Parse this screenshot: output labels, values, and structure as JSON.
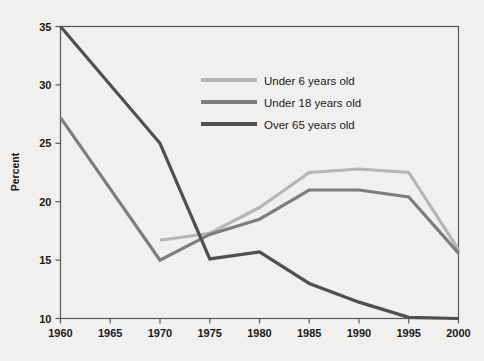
{
  "chart_data": {
    "type": "line",
    "title": "",
    "subtitle": "",
    "xlabel": "",
    "ylabel": "Percent",
    "x": [
      1960,
      1965,
      1970,
      1975,
      1980,
      1985,
      1990,
      1995,
      2000
    ],
    "xtick_labels": [
      "1960",
      "1965",
      "1970",
      "1975",
      "1980",
      "1985",
      "1990",
      "1995",
      "2000"
    ],
    "ytick_labels": [
      "10",
      "15",
      "20",
      "25",
      "30",
      "35"
    ],
    "ytick_values": [
      10,
      15,
      20,
      25,
      30,
      35
    ],
    "xlim": [
      1960,
      2000
    ],
    "ylim": [
      10,
      35
    ],
    "grid": false,
    "legend_position": "top-center",
    "series": [
      {
        "name": "Under 6 years old",
        "color": "#b5b5b5",
        "x": [
          1970,
          1975,
          1980,
          1985,
          1990,
          1995,
          2000
        ],
        "values": [
          16.7,
          17.3,
          19.5,
          22.5,
          22.8,
          22.5,
          15.9
        ]
      },
      {
        "name": "Under 18 years old",
        "color": "#7d7d7d",
        "x": [
          1960,
          1970,
          1975,
          1980,
          1985,
          1990,
          1995,
          2000
        ],
        "values": [
          27.2,
          15.0,
          17.2,
          18.5,
          21.0,
          21.0,
          20.4,
          15.6
        ]
      },
      {
        "name": "Over 65 years old",
        "color": "#4f4f4f",
        "x": [
          1960,
          1970,
          1975,
          1980,
          1985,
          1990,
          1995,
          2000
        ],
        "values": [
          35.0,
          25.0,
          15.1,
          15.7,
          13.0,
          11.4,
          10.1,
          10.0
        ]
      }
    ]
  },
  "legend": {
    "entries": [
      {
        "label": "Under 6 years old",
        "color": "#b5b5b5"
      },
      {
        "label": "Under 18 years old",
        "color": "#7d7d7d"
      },
      {
        "label": "Over 65 years old",
        "color": "#4f4f4f"
      }
    ]
  },
  "axes": {
    "y_title": "Percent"
  },
  "colors": {
    "background": "#f1f0ee",
    "axis": "#58585a",
    "text": "#1a1a1a"
  }
}
